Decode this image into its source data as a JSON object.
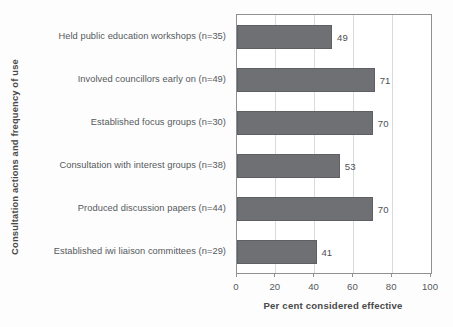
{
  "chart_data": {
    "type": "bar",
    "orientation": "horizontal",
    "title": "",
    "xlabel": "Per cent considered effective",
    "ylabel": "Consultation actions and frequency of use",
    "categories": [
      "Held public education workshops (n=35)",
      "Involved councillors early on (n=49)",
      "Established focus groups (n=30)",
      "Consultation with interest groups (n=38)",
      "Produced discussion papers (n=44)",
      "Established iwi liaison committees (n=29)"
    ],
    "values": [
      49,
      71,
      70,
      53,
      70,
      41
    ],
    "value_labels": [
      "49",
      "71",
      "70",
      "53",
      "70",
      "41"
    ],
    "xlim": [
      0,
      100
    ],
    "xticks": [
      0,
      20,
      40,
      60,
      80,
      100
    ],
    "xtick_labels": [
      "0",
      "20",
      "40",
      "60",
      "80",
      "100"
    ],
    "grid": "vertical-minor",
    "legend": "none",
    "bar_color": "#6e7073",
    "axis_color": "#8e9194",
    "gridline_color": "#d8dadc",
    "text_color": "#55595c"
  }
}
